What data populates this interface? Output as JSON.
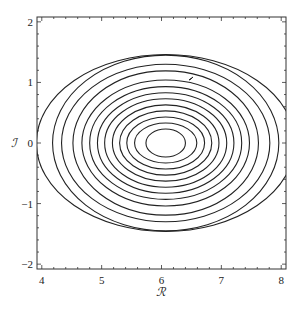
{
  "chart_data": {
    "type": "contour",
    "title": "",
    "xlabel": "ℛ",
    "ylabel": "ℐ",
    "xlim": [
      3.92,
      8.08
    ],
    "ylim": [
      -2.08,
      2.08
    ],
    "x_ticks": [
      "4",
      "5",
      "6",
      "7",
      "8"
    ],
    "y_ticks": [
      "2",
      "1",
      "0",
      "-1",
      "-2"
    ],
    "grid": false,
    "legend": null,
    "contour_center": {
      "x": 6.07,
      "y": 0.0
    },
    "contour_semi_axes_x": [
      0.33,
      0.52,
      0.65,
      0.77,
      0.89,
      1.02,
      1.14,
      1.27,
      1.4,
      1.55,
      1.74,
      1.89,
      2.16
    ],
    "contour_semi_axes_y": [
      0.23,
      0.33,
      0.43,
      0.53,
      0.63,
      0.73,
      0.83,
      0.93,
      1.04,
      1.19,
      1.3,
      1.45,
      1.46
    ],
    "annotation": "small arrow mark near (6.5, 1.05)",
    "line_color": "#222222"
  }
}
